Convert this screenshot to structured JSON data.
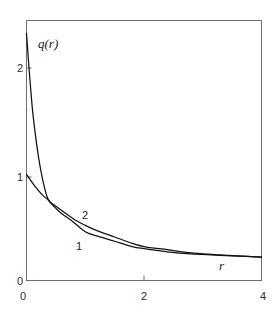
{
  "figure": {
    "background": "#ffffff",
    "frame_color": "#6e6e6e",
    "curve_color": "#111111"
  },
  "axes": {
    "x_name": "r",
    "y_name": "q(r)",
    "x_ticks": [
      "0",
      "2",
      "4"
    ],
    "y_ticks": [
      "0",
      "1",
      "2"
    ],
    "origin_label": "0"
  },
  "labels": {
    "curve1": "1",
    "curve2": "2"
  },
  "chart_data": {
    "type": "line",
    "title": "",
    "xlabel": "r",
    "ylabel": "q(r)",
    "xlim": [
      0,
      4
    ],
    "ylim": [
      0,
      2.45
    ],
    "xticks": [
      0,
      2,
      4
    ],
    "yticks": [
      0,
      1,
      2
    ],
    "grid": false,
    "legend": "inline-curve-labels",
    "annotations": [
      {
        "text": "1",
        "x": 0.95,
        "y": 0.33,
        "refers_to": "curve 1"
      },
      {
        "text": "2",
        "x": 1.05,
        "y": 0.52,
        "refers_to": "curve 2"
      }
    ],
    "series": [
      {
        "name": "1",
        "x": [
          0,
          0.1,
          0.2,
          0.3,
          0.35,
          0.4,
          0.5,
          0.6,
          0.8,
          1.0,
          1.2,
          1.5,
          1.8,
          2.0,
          2.4,
          2.8,
          3.2,
          3.6,
          4.0
        ],
        "values": [
          1.0,
          0.92,
          0.85,
          0.79,
          0.77,
          0.74,
          0.68,
          0.63,
          0.55,
          0.46,
          0.42,
          0.37,
          0.32,
          0.3,
          0.27,
          0.25,
          0.24,
          0.23,
          0.22
        ]
      },
      {
        "name": "2",
        "x": [
          0,
          0.05,
          0.1,
          0.15,
          0.2,
          0.25,
          0.3,
          0.35,
          0.4,
          0.5,
          0.6,
          0.8,
          1.0,
          1.2,
          1.5,
          1.8,
          2.0,
          2.4,
          2.8,
          3.2,
          3.6,
          4.0
        ],
        "values": [
          2.33,
          1.95,
          1.62,
          1.38,
          1.18,
          1.02,
          0.89,
          0.79,
          0.74,
          0.7,
          0.66,
          0.58,
          0.52,
          0.47,
          0.41,
          0.35,
          0.32,
          0.29,
          0.26,
          0.245,
          0.232,
          0.22
        ]
      }
    ]
  }
}
